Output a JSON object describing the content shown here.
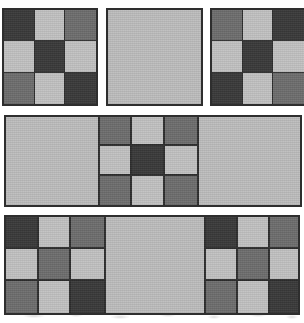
{
  "figure": {
    "background_color": "#ffffff",
    "width": 304,
    "height": 323,
    "border_color": "#2e2e2e"
  },
  "palette": {
    "dark": "#3a3a3a",
    "medium": "#6e6e6e",
    "light": "#c2c2c2",
    "plain": "#bdbdbd",
    "border": "#2e2e2e"
  },
  "chart_data": {
    "type": "heatmap",
    "xlabel": "",
    "ylabel": "",
    "grid": false,
    "legend": "none",
    "value_colors": {
      "0": "#3a3a3a",
      "1": "#c2c2c2",
      "2": "#6e6e6e",
      "3": "#bdbdbd"
    },
    "value_names": {
      "0": "dark",
      "1": "light",
      "2": "medium",
      "3": "plain"
    },
    "rows": [
      {
        "row_index": 0,
        "label": "top-row",
        "x": 2,
        "y": 8,
        "width": 300,
        "height": 98,
        "tiles": [
          {
            "tile_index": 0,
            "name": "checker-tile-top-left",
            "kind": "checker",
            "x": 2,
            "y": 8,
            "width": 96,
            "height": 98,
            "matrix": [
              [
                0,
                1,
                2
              ],
              [
                1,
                0,
                1
              ],
              [
                2,
                1,
                0
              ]
            ]
          },
          {
            "tile_index": 1,
            "name": "plain-tile-top-center",
            "kind": "solid",
            "x": 106,
            "y": 8,
            "width": 97,
            "height": 98,
            "value": 3
          },
          {
            "tile_index": 2,
            "name": "checker-tile-top-right",
            "kind": "checker",
            "x": 210,
            "y": 8,
            "width": 96,
            "height": 98,
            "clipped_right": true,
            "matrix": [
              [
                2,
                1,
                0
              ],
              [
                1,
                0,
                1
              ],
              [
                0,
                1,
                2
              ]
            ]
          }
        ]
      },
      {
        "row_index": 1,
        "label": "middle-row",
        "x": 4,
        "y": 115,
        "width": 298,
        "height": 92,
        "tiles": [
          {
            "tile_index": 0,
            "name": "middle-strip",
            "kind": "strip",
            "x": 4,
            "y": 115,
            "width": 298,
            "height": 92,
            "segments": [
              {
                "name": "plain-block-left",
                "kind": "solid",
                "flex": 92,
                "value": 3
              },
              {
                "name": "checker-block-center",
                "kind": "checker",
                "flex": 99,
                "matrix": [
                  [
                    2,
                    1,
                    2
                  ],
                  [
                    1,
                    0,
                    1
                  ],
                  [
                    2,
                    1,
                    2
                  ]
                ]
              },
              {
                "name": "plain-block-right",
                "kind": "solid",
                "flex": 107,
                "value": 3
              }
            ]
          }
        ]
      },
      {
        "row_index": 2,
        "label": "bottom-row",
        "x": 4,
        "y": 215,
        "width": 296,
        "height": 100,
        "tiles": [
          {
            "tile_index": 0,
            "name": "bottom-strip",
            "kind": "strip",
            "x": 4,
            "y": 215,
            "width": 296,
            "height": 100,
            "segments": [
              {
                "name": "checker-block-bottom-left",
                "kind": "checker",
                "flex": 98,
                "matrix": [
                  [
                    0,
                    1,
                    2
                  ],
                  [
                    1,
                    2,
                    1
                  ],
                  [
                    2,
                    1,
                    0
                  ]
                ]
              },
              {
                "name": "plain-block-bottom-center",
                "kind": "solid",
                "flex": 100,
                "value": 3
              },
              {
                "name": "checker-block-bottom-right",
                "kind": "checker",
                "flex": 98,
                "matrix": [
                  [
                    0,
                    1,
                    2
                  ],
                  [
                    1,
                    2,
                    1
                  ],
                  [
                    2,
                    1,
                    0
                  ]
                ]
              }
            ]
          }
        ]
      }
    ]
  }
}
